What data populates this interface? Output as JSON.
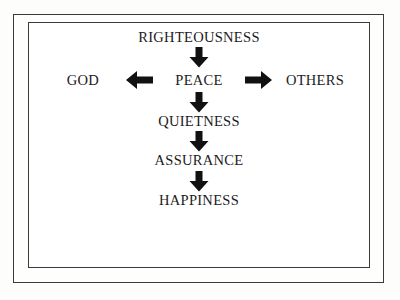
{
  "diagram": {
    "type": "flow-chart",
    "orientation": "vertical-with-horizontal-branch",
    "colors": {
      "ink": "#1b1b1d",
      "border": "#3a3a3c",
      "background": "#ffffff",
      "page": "#fdfdfb",
      "arrow": "#111111"
    },
    "nodes": {
      "righteousness": "RIGHTEOUSNESS",
      "peace": "PEACE",
      "god": "GOD",
      "others": "OTHERS",
      "quietness": "QUIETNESS",
      "assurance": "ASSURANCE",
      "happiness": "HAPPINESS"
    },
    "arrows": {
      "righteousness_to_peace": "arrow-down-icon",
      "peace_to_god": "arrow-left-icon",
      "peace_to_others": "arrow-right-icon",
      "peace_to_quietness": "arrow-down-icon",
      "quietness_to_assurance": "arrow-down-icon",
      "assurance_to_happiness": "arrow-down-icon"
    },
    "sequence": [
      "RIGHTEOUSNESS",
      "PEACE",
      "QUIETNESS",
      "ASSURANCE",
      "HAPPINESS"
    ],
    "branches": [
      "GOD",
      "OTHERS"
    ]
  }
}
